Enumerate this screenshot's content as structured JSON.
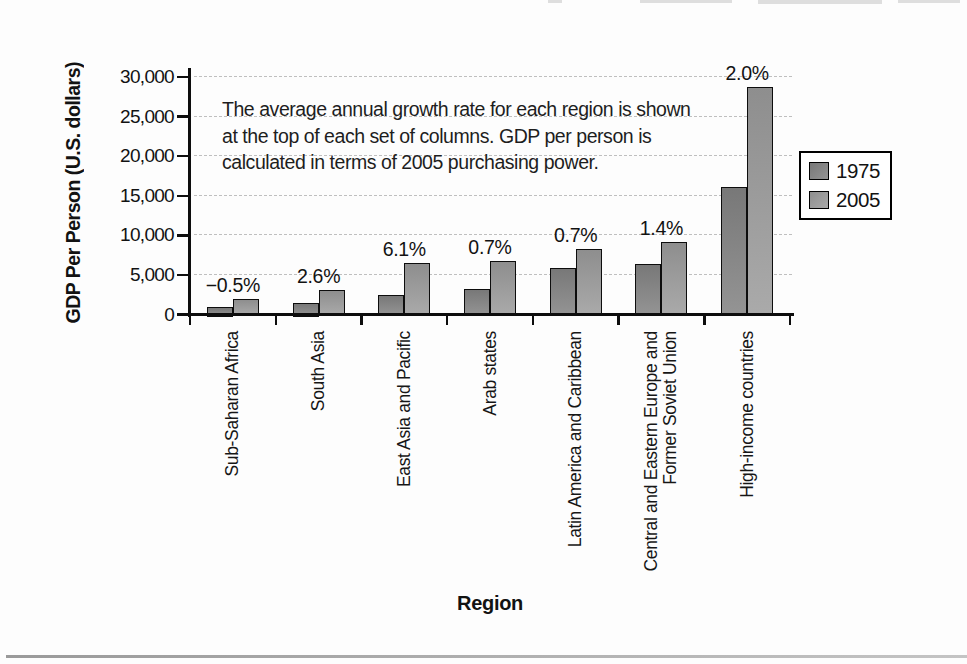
{
  "chart_data": {
    "type": "bar",
    "title": "",
    "xlabel": "Region",
    "ylabel": "GDP Per Person (U.S. dollars)",
    "ylim": [
      0,
      30000
    ],
    "ytick_values": [
      0,
      5000,
      10000,
      15000,
      20000,
      25000,
      30000
    ],
    "ytick_labels": [
      "0",
      "5,000",
      "10,000",
      "15,000",
      "20,000",
      "25,000",
      "30,000"
    ],
    "grid": "horizontal-dashed",
    "legend_position": "right",
    "categories": [
      "Sub-Saharan Africa",
      "South Asia",
      "East Asia and Pacific",
      "Arab states",
      "Latin America and Caribbean",
      "Central and Eastern Europe and\nFormer Soviet Union",
      "High-income countries"
    ],
    "series": [
      {
        "name": "1975",
        "values": [
          900,
          1500,
          2500,
          3200,
          5900,
          6400,
          16100
        ],
        "color_top": "#787878",
        "color_bottom": "#949494"
      },
      {
        "name": "2005",
        "values": [
          2000,
          3100,
          6500,
          6700,
          8300,
          9200,
          28700
        ],
        "color_top": "#8e8e8e",
        "color_bottom": "#aaaaaa"
      }
    ],
    "growth_labels": [
      "−0.5%",
      "2.6%",
      "6.1%",
      "0.7%",
      "0.7%",
      "1.4%",
      "2.0%"
    ],
    "annotation_lines": [
      "The average annual growth rate for each region is shown",
      "at the top of each set of columns. GDP per person is",
      "calculated in terms of 2005 purchasing power."
    ]
  },
  "colors": {
    "axis": "#0d0d0d",
    "gridline": "#bfbfbf",
    "background": "#fdfdfd",
    "bottom_rule": "#a8a8a8"
  }
}
